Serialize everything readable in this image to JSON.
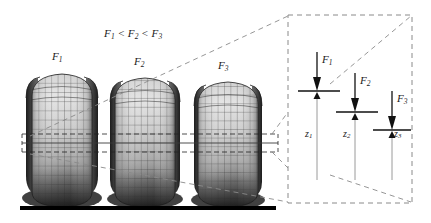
{
  "figure": {
    "name": "tire-deflection-under-increasing-vertical-load",
    "title_relation": "F1 < F2 < F3",
    "title_parts": {
      "f1": "F",
      "f1_sub": "1",
      "lt1": "<",
      "f2": "F",
      "f2_sub": "2",
      "lt2": "<",
      "f3": "F",
      "f3_sub": "3"
    },
    "background_color": "#ffffff",
    "line_color": "#1a1a1a",
    "dash_color": "#8a8a8a",
    "ground_color": "#000000"
  },
  "tires": [
    {
      "id": "tire-1",
      "force_label": "F",
      "force_sub": "1",
      "deflection_label": "z",
      "deflection_sub": "1",
      "cx": 62,
      "top": 74,
      "bottom": 207,
      "width": 78,
      "compression": "least"
    },
    {
      "id": "tire-2",
      "force_label": "F",
      "force_sub": "2",
      "deflection_label": "z",
      "deflection_sub": "2",
      "cx": 145,
      "top": 78,
      "bottom": 207,
      "width": 78,
      "compression": "medium"
    },
    {
      "id": "tire-3",
      "force_label": "F",
      "force_sub": "3",
      "deflection_label": "z",
      "deflection_sub": "3",
      "cx": 228,
      "top": 82,
      "bottom": 207,
      "width": 78,
      "compression": "most"
    }
  ],
  "tire_labels": [
    {
      "name": "tire-1-force-label",
      "text": "F",
      "sub": "1",
      "x": 52,
      "y": 50
    },
    {
      "name": "tire-2-force-label",
      "text": "F",
      "sub": "2",
      "x": 134,
      "y": 55
    },
    {
      "name": "tire-3-force-label",
      "text": "F",
      "sub": "3",
      "x": 218,
      "y": 59
    }
  ],
  "inset": {
    "name": "magnified-deflection-inset",
    "box": {
      "x": 288,
      "y": 15,
      "w": 124,
      "h": 188
    },
    "arrows": [
      {
        "name": "inset-force-1",
        "label": "F",
        "sub": "1",
        "x": 317,
        "arrow_top": 52,
        "contact_y": 91,
        "bar_x1": 298,
        "bar_x2": 340,
        "z_label": "z",
        "z_sub": "1",
        "z_x": 314,
        "z_y": 140,
        "z_bottom": 180,
        "label_x": 323,
        "label_y": 60,
        "z_label_x": 308,
        "z_label_y": 134
      },
      {
        "name": "inset-force-2",
        "label": "F",
        "sub": "2",
        "x": 355,
        "arrow_top": 73,
        "contact_y": 112,
        "bar_x1": 336,
        "bar_x2": 378,
        "z_label": "z",
        "z_sub": "2",
        "z_x": 352,
        "z_y": 150,
        "z_bottom": 180,
        "label_x": 361,
        "label_y": 81,
        "z_label_x": 346,
        "z_label_y": 134
      },
      {
        "name": "inset-force-3",
        "label": "F",
        "sub": "3",
        "x": 392,
        "arrow_top": 91,
        "contact_y": 130,
        "bar_x1": 373,
        "bar_x2": 411,
        "z_label": "z",
        "z_sub": "3",
        "z_x": 389,
        "z_y": 160,
        "z_bottom": 180,
        "label_x": 398,
        "label_y": 99,
        "z_label_x": 383,
        "z_label_y": 134
      }
    ]
  },
  "ground": {
    "name": "ground-line",
    "x1": 20,
    "x2": 276,
    "y": 208,
    "thickness": 4
  },
  "reference_lines": {
    "upper_dashed_y": 134,
    "solid_y": 143,
    "lower_dashed_y": 152,
    "x_start": 22,
    "x_end": 278
  }
}
